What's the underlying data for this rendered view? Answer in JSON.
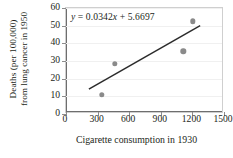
{
  "chart_data": {
    "type": "scatter",
    "title": "",
    "xlabel": "Cigarette consumption in 1930",
    "ylabel_lines": [
      "Deaths (per 100,000)",
      "from lung cancer in 1950"
    ],
    "xlim": [
      0,
      1500
    ],
    "ylim": [
      0,
      60
    ],
    "xticks": [
      0,
      300,
      600,
      900,
      1200,
      1500
    ],
    "yticks": [
      0,
      10,
      20,
      30,
      40,
      50,
      60
    ],
    "xtick_labels": [
      "0",
      "300",
      "600",
      "900",
      "1200",
      "1500"
    ],
    "ytick_labels": [
      "0",
      "10",
      "20",
      "30",
      "40",
      "50",
      "60"
    ],
    "grid": "horizontal",
    "legend": "none",
    "points": [
      {
        "x": 340,
        "y": 11.0
      },
      {
        "x": 465,
        "y": 28.5
      },
      {
        "x": 1115,
        "y": 35.5
      },
      {
        "x": 1205,
        "y": 52.5
      }
    ],
    "trendline": {
      "slope": 0.0342,
      "intercept": 5.6697,
      "x_start": 220,
      "x_end": 1290,
      "equation_parts": {
        "y": "y",
        "eq": " = 0.0342",
        "x": "x",
        "plus": " + 5.6697"
      },
      "equation_text": "y = 0.0342x + 5.6697"
    },
    "colors": {
      "marker": "#8a8a8a",
      "trendline": "#2b2b2b",
      "grid": "#f0f0f0",
      "frame": "#cfcfcf",
      "axis": "#6e6e6e",
      "text": "#231f20",
      "background": "#ffffff"
    }
  }
}
